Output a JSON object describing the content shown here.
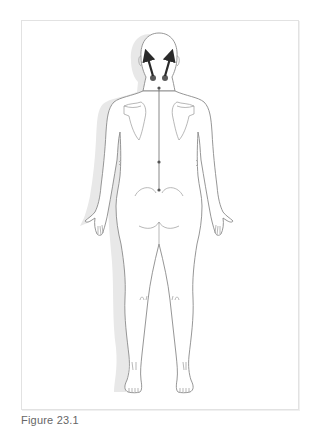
{
  "figure": {
    "caption": "Figure 23.1",
    "view": "posterior body outline",
    "annotations": {
      "arrows": 2,
      "arrow_direction": "upward from base of skull toward top of head",
      "origin_points": 2,
      "spine_markers": 3
    },
    "colors": {
      "outline": "#8a8a8a",
      "shadow": "#e6e6e6",
      "arrow": "#2a2a2a",
      "frame": "#e2e2e2"
    }
  }
}
